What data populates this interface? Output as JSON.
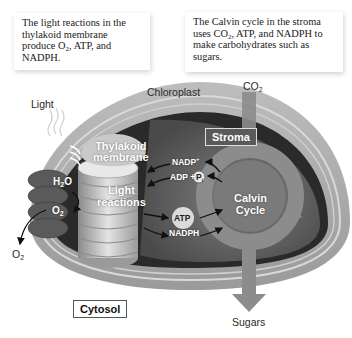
{
  "callouts": {
    "light_reactions": {
      "line1": "The light reactions in the",
      "line2": "thylakoid membrane",
      "line3_pre": "produce O",
      "line3_sub": "2",
      "line3_post": ", ATP, and",
      "line4": "NADPH."
    },
    "calvin_cycle": {
      "line1": "The Calvin cycle in the stroma",
      "line2_pre": "uses CO",
      "line2_sub": "2",
      "line2_post": ", ATP, and NADPH to",
      "line3": "make carbohydrates such as",
      "line4": "sugars."
    }
  },
  "labels": {
    "light": "Light",
    "chloroplast": "Chloroplast",
    "co2": "CO",
    "co2_sub": "2",
    "stroma": "Stroma",
    "thylakoid_line1": "Thylakoid",
    "thylakoid_line2": "membrane",
    "h2o_pre": "H",
    "h2o_sub": "2",
    "h2o_post": "O",
    "o2_inner": "O",
    "o2_inner_sub": "2",
    "o2_outer": "O",
    "o2_outer_sub": "2",
    "light_reactions_line1": "Light",
    "light_reactions_line2": "reactions",
    "nadp_plus": "NADP",
    "nadp_sup": "+",
    "adp_plus": "ADP +",
    "pi": "P",
    "pi_sub": "i",
    "atp": "ATP",
    "nadph": "NADPH",
    "calvin_line1": "Calvin",
    "calvin_line2": "Cycle",
    "cytosol": "Cytosol",
    "sugars": "Sugars"
  },
  "colors": {
    "outer_membrane": "#a9a9a9",
    "inner_dark": "#3a3a3a",
    "stroma": "#6e6e6e",
    "thylakoid": "#c8c8c8",
    "calvin_ring": "#8c8c8c"
  }
}
